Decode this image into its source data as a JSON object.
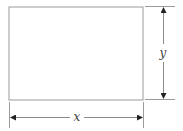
{
  "diagram": {
    "type": "dimensioned-rectangle",
    "colors": {
      "background": "#ffffff",
      "rectangle_stroke": "#9a9a9a",
      "dimension_line": "#8a8a8a",
      "arrowhead": "#222222",
      "label": "#444444"
    },
    "rectangle": {
      "x": 9,
      "y": 7,
      "width": 134,
      "height": 93
    },
    "dimensions": {
      "width": {
        "label": "x",
        "orientation": "horizontal"
      },
      "height": {
        "label": "y",
        "orientation": "vertical"
      }
    }
  }
}
